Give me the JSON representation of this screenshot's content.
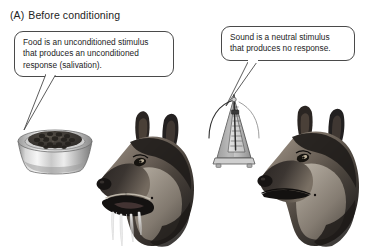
{
  "panel": {
    "label": "(A)",
    "title": "Before conditioning"
  },
  "bubbles": {
    "food": {
      "name": "food-caption",
      "lines": [
        "Food is an unconditioned stimulus",
        "that produces an unconditioned",
        "response (salivation)."
      ]
    },
    "sound": {
      "name": "sound-caption",
      "lines": [
        "Sound is a neutral stimulus",
        "that produces no response."
      ]
    }
  },
  "figures": {
    "bowl": {
      "icon": "food-bowl-icon",
      "contents": "kibble"
    },
    "metronome": {
      "icon": "metronome-icon",
      "state": "ticking"
    },
    "dog_left": {
      "icon": "dog-head-salivating-icon",
      "response": "salivation"
    },
    "dog_right": {
      "icon": "dog-head-neutral-icon",
      "response": "none"
    }
  },
  "colors": {
    "background": "#ffffff",
    "ink": "#1c1c1c",
    "outline": "#4a4a4a",
    "bowl_metal_light": "#f2f2f2",
    "bowl_metal_mid": "#b8b8b8",
    "bowl_metal_dark": "#7d7d7d",
    "kibble": "#3c3a38",
    "metronome_body": "#b9b9b9",
    "metronome_shade": "#8e8e8e",
    "dog_dark": "#26221f",
    "dog_mid": "#6d6358",
    "dog_light": "#c9c2b8",
    "drool": "#e8e8e8"
  }
}
